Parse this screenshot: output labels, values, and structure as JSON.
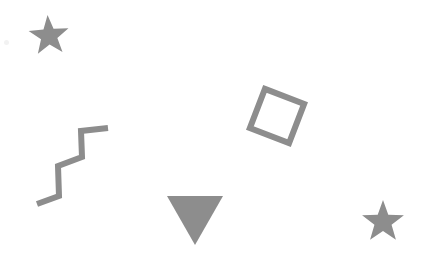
{
  "canvas": {
    "width": 445,
    "height": 260,
    "background_color": "#ffffff",
    "shape_color": "#8d8d8d",
    "shape_color_light": "#a0a0a0",
    "shape_count": 5
  },
  "shapes": [
    {
      "name": "star-top-left",
      "kind": "star",
      "label": "Star",
      "fill": "filled",
      "color": "#8d8d8d",
      "center_x": 49,
      "center_y": 36,
      "outer_radius": 21,
      "inner_radius": 8.6,
      "points": 5,
      "rotation_deg": -4
    },
    {
      "name": "zigzag-left",
      "kind": "zigzag",
      "label": "Zigzag line",
      "fill": "stroke",
      "color": "#8d8d8d",
      "stroke_width": 6,
      "vertices": [
        [
          37,
          204
        ],
        [
          59,
          196
        ],
        [
          58,
          166
        ],
        [
          82,
          157
        ],
        [
          81,
          131
        ],
        [
          108,
          128
        ]
      ]
    },
    {
      "name": "square-rotated",
      "kind": "square",
      "label": "Rotated square",
      "fill": "stroke",
      "color": "#8d8d8d",
      "stroke_width": 6,
      "center_x": 277,
      "center_y": 116,
      "side": 42,
      "rotation_deg": 21
    },
    {
      "name": "triangle-down",
      "kind": "triangle",
      "label": "Downward triangle",
      "fill": "filled",
      "color": "#8d8d8d",
      "apex_x": 195,
      "apex_y": 245,
      "top_left_x": 167,
      "top_left_y": 196,
      "top_right_x": 223,
      "top_right_y": 196
    },
    {
      "name": "star-bottom-right",
      "kind": "star",
      "label": "Star",
      "fill": "filled",
      "color": "#8d8d8d",
      "center_x": 383,
      "center_y": 222,
      "outer_radius": 22,
      "inner_radius": 9,
      "points": 5,
      "rotation_deg": 0
    }
  ]
}
